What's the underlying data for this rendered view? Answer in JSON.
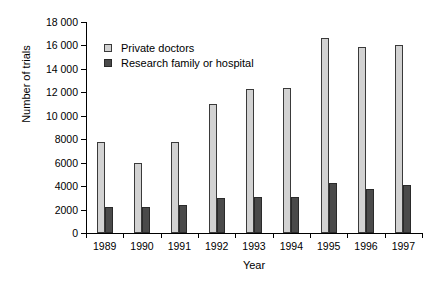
{
  "chart_data": {
    "type": "bar",
    "title": "",
    "xlabel": "Year",
    "ylabel": "Number of trials",
    "categories": [
      "1989",
      "1990",
      "1991",
      "1992",
      "1993",
      "1994",
      "1995",
      "1996",
      "1997"
    ],
    "series": [
      {
        "name": "Private doctors",
        "color": "#d2d2d2",
        "values": [
          7800,
          6000,
          7800,
          11000,
          12300,
          12350,
          16650,
          15900,
          16000
        ]
      },
      {
        "name": "Research family or hospital",
        "color": "#4a4a4a",
        "values": [
          2200,
          2200,
          2350,
          3000,
          3050,
          3100,
          4250,
          3750,
          4100
        ]
      }
    ],
    "ylim": [
      0,
      18000
    ],
    "ytick_step": 2000,
    "ytick_labels": [
      "0",
      "2000",
      "4000",
      "6000",
      "8000",
      "10 000",
      "12 000",
      "14 000",
      "16 000",
      "18 000"
    ],
    "grid": false,
    "legend_position": "top-left-inside"
  }
}
